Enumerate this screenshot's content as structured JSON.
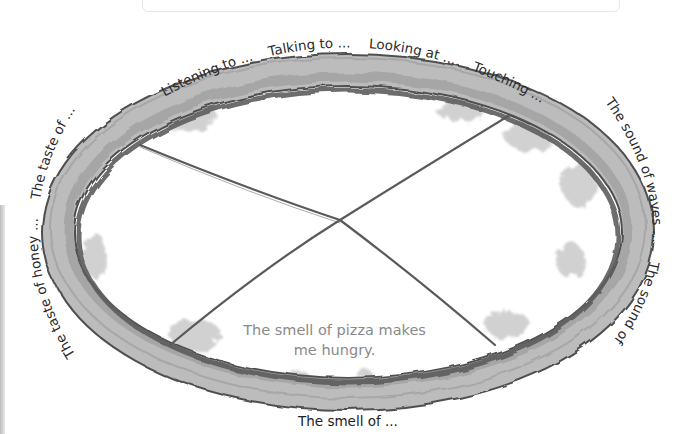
{
  "worksheet": {
    "top_box": "",
    "labels_top": [
      "Listening to ...",
      "Talking to ...",
      "Looking at ...",
      "Touching ..."
    ],
    "labels_right": [
      "The sound of waves ...",
      "The sound of ..."
    ],
    "labels_left": [
      "The taste of ...",
      "The taste of honey ..."
    ],
    "label_bottom": "The smell of ...",
    "example_sentence_line1": "The smell of pizza makes",
    "example_sentence_line2": "me hungry."
  },
  "colors": {
    "ring_light": "#b8b8b8",
    "ring_dark": "#6e6e6e",
    "ring_edge": "#4a4a4a",
    "example_text": "#8a8a8a",
    "label_text": "#2a2a2a"
  }
}
